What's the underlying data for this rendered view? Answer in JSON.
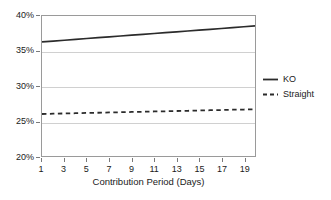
{
  "chart_data": {
    "type": "line",
    "title": "",
    "xlabel": "Contribution Period (Days)",
    "ylabel": "",
    "xlim": [
      1,
      20
    ],
    "ylim": [
      20,
      40
    ],
    "grid": true,
    "legend_position": "right",
    "y_tick_labels": [
      "40%",
      "35%",
      "30%",
      "25%",
      "20%"
    ],
    "y_tick_values": [
      40,
      35,
      30,
      25,
      20
    ],
    "x_tick_labels": [
      "1",
      "3",
      "5",
      "7",
      "9",
      "11",
      "13",
      "15",
      "17",
      "19"
    ],
    "x_tick_values": [
      1,
      3,
      5,
      7,
      9,
      11,
      13,
      15,
      17,
      19
    ],
    "x": [
      1,
      2,
      3,
      4,
      5,
      6,
      7,
      8,
      9,
      10,
      11,
      12,
      13,
      14,
      15,
      16,
      17,
      18,
      19,
      20
    ],
    "series": [
      {
        "name": "KO",
        "style": "solid",
        "color": "#2b2b2b",
        "values": [
          36.3,
          36.42,
          36.54,
          36.66,
          36.78,
          36.9,
          37.02,
          37.14,
          37.26,
          37.38,
          37.5,
          37.62,
          37.74,
          37.86,
          37.98,
          38.1,
          38.22,
          38.34,
          38.46,
          38.6
        ]
      },
      {
        "name": "Straight",
        "style": "dashed",
        "color": "#2b2b2b",
        "values": [
          26.0,
          26.04,
          26.08,
          26.11,
          26.15,
          26.18,
          26.22,
          26.25,
          26.29,
          26.32,
          26.36,
          26.39,
          26.43,
          26.46,
          26.5,
          26.54,
          26.57,
          26.61,
          26.64,
          26.68
        ]
      }
    ]
  },
  "legend": {
    "entries": [
      {
        "label": "KO"
      },
      {
        "label": "Straight"
      }
    ]
  },
  "axis": {
    "x_title": "Contribution Period (Days)"
  },
  "colors": {
    "series": "#2b2b2b",
    "gridline": "#d0d0d0",
    "frame": "#9a9a9a",
    "background": "#ffffff",
    "text": "#1a1a1a"
  }
}
